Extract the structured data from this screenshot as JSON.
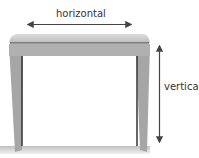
{
  "diagram": {
    "labels": {
      "horizontal": "horizontal",
      "vertical": "vertical"
    },
    "colors": {
      "table_body": "#a9a9a9",
      "table_top": "#b8b8b8",
      "edge_line": "#3a3a3a",
      "arrow": "#444444",
      "shadow": "#c8c8c8"
    }
  }
}
